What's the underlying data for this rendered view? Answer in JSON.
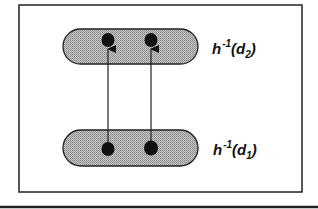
{
  "diagram": {
    "type": "set-mapping",
    "sets": [
      {
        "id": "upper",
        "label": {
          "base": "h",
          "superscript": "-1",
          "open": "(",
          "arg": "d",
          "subscript": "2",
          "close": ")"
        },
        "points": 2
      },
      {
        "id": "lower",
        "label": {
          "base": "h",
          "superscript": "-1",
          "open": "(",
          "arg": "d",
          "subscript": "1",
          "close": ")"
        },
        "points": 2
      }
    ],
    "arrows": [
      {
        "from": "lower.point1",
        "to": "upper.point1"
      },
      {
        "from": "lower.point2",
        "to": "upper.point2"
      }
    ],
    "colors": {
      "frame": "#222222",
      "pill_fill": "#b8b8b8",
      "pill_stroke": "#222222",
      "point": "#111111",
      "arrow": "#222222"
    }
  }
}
